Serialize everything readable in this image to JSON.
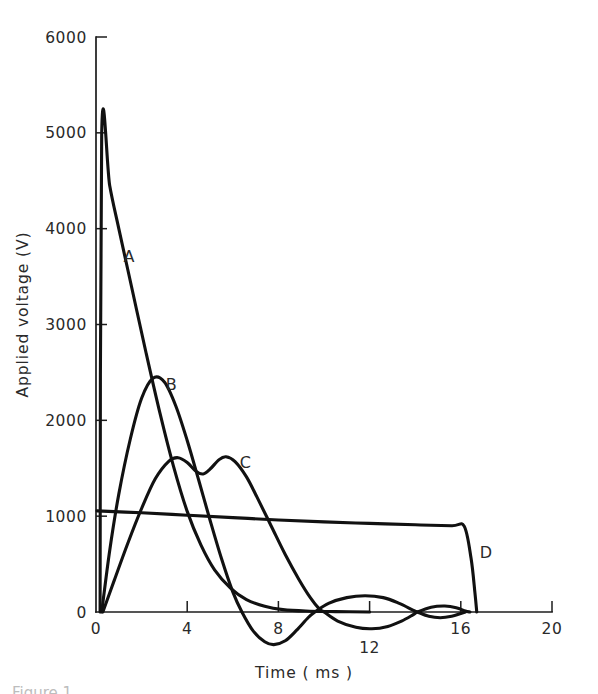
{
  "figure": {
    "background_color": "#ffffff",
    "line_color": "#111111",
    "text_color": "#2a2a2a",
    "caption_partial": "Figure 1"
  },
  "chart_data": {
    "type": "line",
    "title": "",
    "xlabel": "Time ( ms )",
    "ylabel": "Applied  voltage (V)",
    "xlim": [
      0,
      20
    ],
    "ylim": [
      0,
      6000
    ],
    "xticks": [
      0,
      4,
      8,
      12,
      16,
      20
    ],
    "xtick_labels": [
      "0",
      "4",
      "8",
      "12",
      "16",
      "20"
    ],
    "yticks": [
      0,
      1000,
      2000,
      3000,
      4000,
      5000,
      6000
    ],
    "ytick_labels": [
      "0",
      "1000",
      "2000",
      "3000",
      "4000",
      "5000",
      "6000"
    ],
    "grid": false,
    "legend": "inline curve labels",
    "series": [
      {
        "name": "A",
        "label": "A",
        "label_x": 1.45,
        "label_y": 3700,
        "description": "steep exponential decay from 5000 V",
        "points": [
          [
            0.18,
            0
          ],
          [
            0.25,
            5000
          ],
          [
            0.6,
            4450
          ],
          [
            1.0,
            4000
          ],
          [
            1.6,
            3350
          ],
          [
            2.2,
            2700
          ],
          [
            2.8,
            2080
          ],
          [
            3.4,
            1520
          ],
          [
            4.0,
            1050
          ],
          [
            4.6,
            700
          ],
          [
            5.2,
            440
          ],
          [
            5.9,
            250
          ],
          [
            6.6,
            130
          ],
          [
            7.4,
            60
          ],
          [
            8.2,
            25
          ],
          [
            9.2,
            10
          ],
          [
            10.5,
            4
          ],
          [
            12.0,
            0
          ]
        ]
      },
      {
        "name": "B",
        "label": "B",
        "label_x": 3.3,
        "label_y": 2370,
        "description": "single large peak near 2450 V at 2.5 ms, then undershoot and damped oscillation",
        "points": [
          [
            0.25,
            0
          ],
          [
            0.6,
            640
          ],
          [
            1.0,
            1230
          ],
          [
            1.5,
            1800
          ],
          [
            2.0,
            2230
          ],
          [
            2.5,
            2440
          ],
          [
            3.0,
            2400
          ],
          [
            3.5,
            2150
          ],
          [
            4.0,
            1790
          ],
          [
            4.5,
            1380
          ],
          [
            5.0,
            960
          ],
          [
            5.5,
            560
          ],
          [
            6.0,
            210
          ],
          [
            6.4,
            0
          ],
          [
            6.9,
            -200
          ],
          [
            7.4,
            -310
          ],
          [
            7.8,
            -340
          ],
          [
            8.3,
            -300
          ],
          [
            8.8,
            -190
          ],
          [
            9.3,
            -60
          ],
          [
            9.6,
            0
          ],
          [
            10.2,
            90
          ],
          [
            11.0,
            150
          ],
          [
            11.8,
            170
          ],
          [
            12.6,
            150
          ],
          [
            13.3,
            90
          ],
          [
            13.9,
            20
          ],
          [
            14.1,
            0
          ],
          [
            14.6,
            -45
          ],
          [
            15.1,
            -60
          ],
          [
            15.6,
            -45
          ],
          [
            16.0,
            -15
          ],
          [
            16.2,
            0
          ]
        ]
      },
      {
        "name": "C",
        "label": "C",
        "label_x": 6.55,
        "label_y": 1560,
        "description": "twin humps near 1600 V at 3.5 ms and 5.5 ms, then decay with small negative oscillation",
        "points": [
          [
            0.3,
            0
          ],
          [
            0.8,
            330
          ],
          [
            1.4,
            720
          ],
          [
            2.0,
            1080
          ],
          [
            2.6,
            1390
          ],
          [
            3.2,
            1575
          ],
          [
            3.6,
            1610
          ],
          [
            4.0,
            1560
          ],
          [
            4.4,
            1465
          ],
          [
            4.7,
            1440
          ],
          [
            5.0,
            1490
          ],
          [
            5.4,
            1590
          ],
          [
            5.7,
            1620
          ],
          [
            6.1,
            1570
          ],
          [
            6.6,
            1410
          ],
          [
            7.1,
            1180
          ],
          [
            7.7,
            890
          ],
          [
            8.3,
            600
          ],
          [
            8.9,
            340
          ],
          [
            9.4,
            150
          ],
          [
            9.8,
            30
          ],
          [
            10.0,
            0
          ],
          [
            10.6,
            -95
          ],
          [
            11.4,
            -160
          ],
          [
            12.1,
            -175
          ],
          [
            12.8,
            -150
          ],
          [
            13.4,
            -95
          ],
          [
            13.9,
            -30
          ],
          [
            14.1,
            0
          ],
          [
            14.7,
            50
          ],
          [
            15.3,
            62
          ],
          [
            15.8,
            45
          ],
          [
            16.2,
            10
          ],
          [
            16.4,
            0
          ]
        ]
      },
      {
        "name": "D",
        "label": "D",
        "label_x": 17.1,
        "label_y": 620,
        "description": "flat plateau slowly falling from 1050 V to 900 V, sharp cut-off to zero just past 16 ms",
        "points": [
          [
            0.05,
            1055
          ],
          [
            2.0,
            1035
          ],
          [
            4.0,
            1010
          ],
          [
            6.0,
            985
          ],
          [
            8.0,
            960
          ],
          [
            10.0,
            940
          ],
          [
            12.0,
            925
          ],
          [
            14.0,
            910
          ],
          [
            15.6,
            900
          ],
          [
            16.15,
            895
          ],
          [
            16.45,
            560
          ],
          [
            16.62,
            200
          ],
          [
            16.7,
            0
          ]
        ]
      }
    ]
  }
}
